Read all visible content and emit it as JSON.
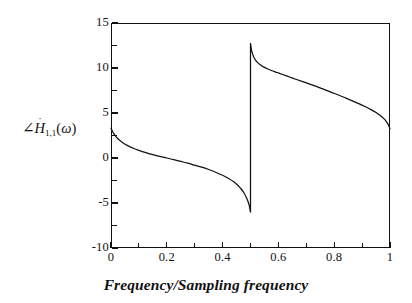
{
  "figure": {
    "background_color": "#ffffff",
    "line_color": "#111111",
    "axis_color": "#111111"
  },
  "axis_titles": {
    "x": "Frequency/Sampling frequency",
    "y_angle_symbol": "∠",
    "y_var": "H",
    "y_dot": "˙",
    "y_subscript": "1,1",
    "y_open_paren": "(",
    "y_omega": "ω",
    "y_close_paren": ")",
    "y_full": "∠Ḣ₁,₁(ω)"
  },
  "ticks": {
    "x": [
      "0",
      "0.2",
      "0.4",
      "0.6",
      "0.8",
      "1"
    ],
    "y": [
      "15",
      "10",
      "5",
      "0",
      "-5",
      "-10"
    ]
  },
  "chart_data": {
    "type": "line",
    "title": "",
    "subtitle": "",
    "xlabel": "Frequency/Sampling frequency",
    "ylabel": "∠Ḣ₁,₁(ω)",
    "xlim": [
      0,
      1
    ],
    "ylim": [
      -10,
      15
    ],
    "xticks": [
      0,
      0.2,
      0.4,
      0.6,
      0.8,
      1
    ],
    "yticks": [
      -10,
      -5,
      0,
      5,
      10,
      15
    ],
    "xtick_minor_step": 0.1,
    "ytick_minor_step": 2.5,
    "grid": false,
    "legend": null,
    "legend_position": "none",
    "annotations": [],
    "discontinuity_x": 0.5,
    "discontinuity_from": -6.0,
    "discontinuity_to": 12.7,
    "series": [
      {
        "name": "phase_branch_left",
        "x": [
          0.0,
          0.01,
          0.02,
          0.03,
          0.045,
          0.06,
          0.08,
          0.1,
          0.125,
          0.15,
          0.175,
          0.2,
          0.225,
          0.25,
          0.275,
          0.3,
          0.325,
          0.35,
          0.375,
          0.4,
          0.42,
          0.44,
          0.455,
          0.468,
          0.478,
          0.486,
          0.492,
          0.496,
          0.499,
          0.5
        ],
        "y": [
          3.3,
          2.7,
          2.3,
          2.0,
          1.65,
          1.38,
          1.08,
          0.85,
          0.6,
          0.38,
          0.18,
          0.0,
          -0.18,
          -0.38,
          -0.58,
          -0.8,
          -1.02,
          -1.28,
          -1.58,
          -1.92,
          -2.25,
          -2.65,
          -3.05,
          -3.5,
          -3.95,
          -4.45,
          -4.92,
          -5.35,
          -5.8,
          -6.0
        ]
      },
      {
        "name": "phase_branch_right",
        "x": [
          0.5,
          0.503,
          0.507,
          0.512,
          0.518,
          0.525,
          0.535,
          0.545,
          0.56,
          0.575,
          0.595,
          0.615,
          0.64,
          0.665,
          0.69,
          0.715,
          0.74,
          0.765,
          0.79,
          0.815,
          0.84,
          0.865,
          0.89,
          0.912,
          0.932,
          0.95,
          0.965,
          0.977,
          0.987,
          0.994,
          1.0
        ],
        "y": [
          12.7,
          12.1,
          11.6,
          11.2,
          10.88,
          10.62,
          10.35,
          10.15,
          9.92,
          9.72,
          9.5,
          9.28,
          9.0,
          8.72,
          8.45,
          8.18,
          7.9,
          7.6,
          7.3,
          7.0,
          6.68,
          6.35,
          6.02,
          5.7,
          5.38,
          5.05,
          4.72,
          4.4,
          4.05,
          3.7,
          3.25
        ]
      }
    ]
  }
}
